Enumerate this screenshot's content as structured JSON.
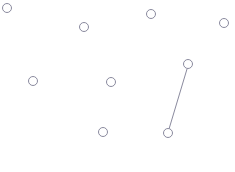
{
  "canvas": {
    "width": 235,
    "height": 172,
    "background_color": "#ffffff",
    "title": "Node Link Graph"
  },
  "style": {
    "node_stroke_color": "#8a8a9e",
    "node_fill_color": "#ffffff",
    "node_stroke_width": 1,
    "node_radius": 4.5,
    "edge_stroke_color": "#8a8a9e",
    "edge_stroke_width": 1
  },
  "graph": {
    "node_count": 9,
    "edge_count": 1,
    "nodes": [
      {
        "id": "n1",
        "label": "",
        "x": 7,
        "y": 8,
        "r": 4.5
      },
      {
        "id": "n2",
        "label": "",
        "x": 84,
        "y": 27,
        "r": 4.5
      },
      {
        "id": "n3",
        "label": "",
        "x": 151,
        "y": 14,
        "r": 4.5
      },
      {
        "id": "n4",
        "label": "",
        "x": 224,
        "y": 23,
        "r": 4.5
      },
      {
        "id": "n5",
        "label": "",
        "x": 33,
        "y": 81,
        "r": 4.5
      },
      {
        "id": "n6",
        "label": "",
        "x": 111,
        "y": 82,
        "r": 4.5
      },
      {
        "id": "n7",
        "label": "",
        "x": 188,
        "y": 64,
        "r": 4.5
      },
      {
        "id": "n8",
        "label": "",
        "x": 103,
        "y": 132,
        "r": 4.5
      },
      {
        "id": "n9",
        "label": "",
        "x": 168,
        "y": 133,
        "r": 4.5
      }
    ],
    "edges": [
      {
        "id": "e1",
        "label": "",
        "source": "n7",
        "target": "n9",
        "x1": 187,
        "y1": 69,
        "x2": 169,
        "y2": 129
      }
    ]
  }
}
